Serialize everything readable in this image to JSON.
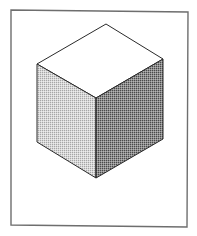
{
  "figure": {
    "background_color": "#ffffff",
    "frame": {
      "stroke_color": "#6e6e6e",
      "corners": [
        [
          11,
          10
        ],
        [
          188,
          12
        ],
        [
          187,
          227
        ],
        [
          11,
          225
        ]
      ]
    },
    "cube": {
      "edge_color": "#2a2a2a",
      "vertices": {
        "top": [
          106,
          24
        ],
        "left_top": [
          37,
          64
        ],
        "right_top": [
          163,
          59
        ],
        "center": [
          96,
          98
        ],
        "left_bottom": [
          37,
          142
        ],
        "right_bottom": [
          163,
          139
        ],
        "bottom": [
          96,
          178
        ]
      },
      "faces": [
        {
          "name": "top",
          "fill": "#ffffff",
          "texture": "none"
        },
        {
          "name": "left",
          "fill": "#c9c9c9",
          "texture": "light-halftone"
        },
        {
          "name": "right",
          "fill": "#8c8c8c",
          "texture": "dark-halftone"
        }
      ]
    }
  }
}
